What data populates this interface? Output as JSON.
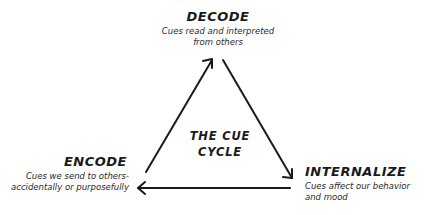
{
  "diagram": {
    "title_lines": [
      "THE CUE",
      "CYCLE"
    ],
    "stroke_color": "#1a1a1a",
    "background_color": "#ffffff",
    "nodes": {
      "decode": {
        "label": "DECODE",
        "description_lines": [
          "Cues read and interpreted",
          "from others"
        ],
        "position": "top"
      },
      "internalize": {
        "label": "INTERNALIZE",
        "description_lines": [
          "Cues affect our behavior",
          "and mood"
        ],
        "position": "bottom-right"
      },
      "encode": {
        "label": "ENCODE",
        "description_lines": [
          "Cues we send to others-",
          "accidentally or purposefully"
        ],
        "position": "bottom-left"
      }
    },
    "arrows": [
      {
        "from": "encode",
        "to": "decode",
        "direction": "up-right"
      },
      {
        "from": "decode",
        "to": "internalize",
        "direction": "down-right"
      },
      {
        "from": "internalize",
        "to": "encode",
        "direction": "left"
      }
    ]
  }
}
